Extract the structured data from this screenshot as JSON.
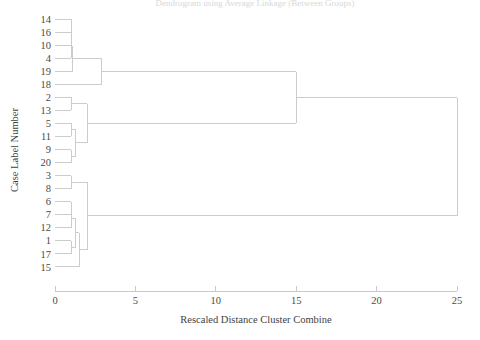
{
  "chart_data": {
    "type": "dendrogram",
    "title": "Dendrogram using Average Linkage (Between Groups)",
    "xlabel": "Rescaled Distance Cluster Combine",
    "ylabel": "Case Label Number",
    "xlim": [
      0,
      25
    ],
    "xticks": [
      0,
      5,
      10,
      15,
      20,
      25
    ],
    "xtick_labels": [
      "0",
      "5",
      "10",
      "15",
      "20",
      "25"
    ],
    "grid": false,
    "legend": false,
    "leaf_order": [
      "14",
      "16",
      "10",
      "4",
      "19",
      "18",
      "2",
      "13",
      "5",
      "11",
      "9",
      "20",
      "3",
      "8",
      "6",
      "7",
      "12",
      "1",
      "17",
      "15"
    ],
    "leaf_count": 20,
    "line_color": "#cccccc",
    "text_color": "#4a4a4a",
    "merges": [
      {
        "id": "m1",
        "children": [
          "14",
          "16"
        ],
        "distance": 1.0
      },
      {
        "id": "m2",
        "children": [
          "m1",
          "10"
        ],
        "distance": 1.0
      },
      {
        "id": "m3",
        "children": [
          "m2",
          "4"
        ],
        "distance": 1.0
      },
      {
        "id": "m4",
        "children": [
          "m3",
          "19"
        ],
        "distance": 1.1
      },
      {
        "id": "m5",
        "children": [
          "m4",
          "18"
        ],
        "distance": 2.9
      },
      {
        "id": "m6",
        "children": [
          "2",
          "13"
        ],
        "distance": 1.0
      },
      {
        "id": "m7",
        "children": [
          "5",
          "11"
        ],
        "distance": 1.0
      },
      {
        "id": "m8",
        "children": [
          "9",
          "20"
        ],
        "distance": 1.0
      },
      {
        "id": "m9",
        "children": [
          "m7",
          "m8"
        ],
        "distance": 1.3
      },
      {
        "id": "m10",
        "children": [
          "m6",
          "m9"
        ],
        "distance": 2.0
      },
      {
        "id": "m11",
        "children": [
          "m5",
          "m10"
        ],
        "distance": 15.0
      },
      {
        "id": "m12",
        "children": [
          "3",
          "8"
        ],
        "distance": 1.0
      },
      {
        "id": "m13",
        "children": [
          "6",
          "7"
        ],
        "distance": 1.0
      },
      {
        "id": "m14",
        "children": [
          "m13",
          "12"
        ],
        "distance": 1.0
      },
      {
        "id": "m15",
        "children": [
          "1",
          "17"
        ],
        "distance": 1.0
      },
      {
        "id": "m16",
        "children": [
          "m14",
          "m15"
        ],
        "distance": 1.3
      },
      {
        "id": "m17",
        "children": [
          "m16",
          "15"
        ],
        "distance": 1.5
      },
      {
        "id": "m18",
        "children": [
          "m12",
          "m17"
        ],
        "distance": 2.0
      },
      {
        "id": "m19",
        "children": [
          "m11",
          "m18"
        ],
        "distance": 25.0
      }
    ]
  },
  "axis": {
    "x_title": "Rescaled Distance Cluster Combine",
    "y_title": "Case Label Number",
    "ticks": [
      "0",
      "5",
      "10",
      "15",
      "20",
      "25"
    ]
  },
  "leaves": [
    {
      "label": "14"
    },
    {
      "label": "16"
    },
    {
      "label": "10"
    },
    {
      "label": "4"
    },
    {
      "label": "19"
    },
    {
      "label": "18"
    },
    {
      "label": "2"
    },
    {
      "label": "13"
    },
    {
      "label": "5"
    },
    {
      "label": "11"
    },
    {
      "label": "9"
    },
    {
      "label": "20"
    },
    {
      "label": "3"
    },
    {
      "label": "8"
    },
    {
      "label": "6"
    },
    {
      "label": "7"
    },
    {
      "label": "12"
    },
    {
      "label": "1"
    },
    {
      "label": "17"
    },
    {
      "label": "15"
    }
  ],
  "title": {
    "text": "Dendrogram using Average Linkage (Between Groups)"
  }
}
